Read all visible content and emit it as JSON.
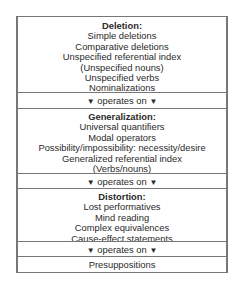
{
  "diagram": {
    "sections": [
      {
        "heading": "Deletion:",
        "items": [
          "Simple deletions",
          "Comparative deletions",
          "Unspecified referential index",
          "(Unspecified nouns)",
          "Unspecified verbs",
          "Nominalizations"
        ]
      },
      {
        "heading": "Generalization:",
        "items": [
          "Universal quantifiers",
          "Modal operators",
          "Possibility/impossibility: necessity/desire",
          "Generalized referential index",
          "(Verbs/nouns)"
        ]
      },
      {
        "heading": "Distortion:",
        "items": [
          "Lost performatives",
          "Mind reading",
          "Complex equivalences",
          "Cause-effect statements"
        ]
      },
      {
        "heading": "",
        "items": [
          "Presuppositions"
        ]
      }
    ],
    "connector": {
      "label": "operates on",
      "arrow": "▼"
    }
  }
}
